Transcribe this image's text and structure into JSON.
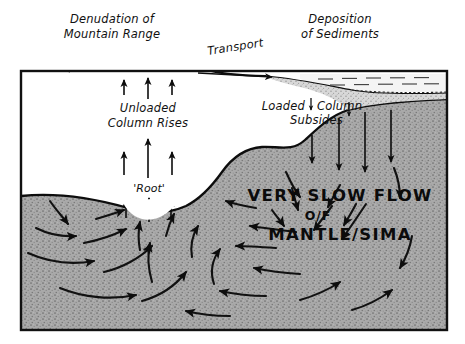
{
  "figure": {
    "frame": {
      "color": "#111111"
    },
    "labels": {
      "denudation_line1": "Denudation of",
      "denudation_line2": "Mountain Range",
      "transport": "Transport",
      "deposition_line1": "Deposition",
      "deposition_line2": "of Sediments",
      "unloaded_line1": "Unloaded",
      "unloaded_line2": "Column Rises",
      "loaded_line1a": "Loaded",
      "loaded_line1b": "Column",
      "loaded_line2": "Subsides",
      "root": "'Root'",
      "flow_line1": "VERY SLOW FLOW",
      "flow_line2": "O/F",
      "flow_line3": "MANTLE/SIMA"
    },
    "colors": {
      "ink": "#0d0d0d",
      "mantle_fill": "#a8a8a8",
      "sediment_fill": "#cfcfcf",
      "crust_fill": "#ffffff",
      "water_fill": "#f2f2f2",
      "paper": "#ffffff"
    },
    "regions": {
      "mantle_name": "mantle-sima",
      "crust_name": "crust-column",
      "sediment_name": "sediment-wedge",
      "water_name": "water-body"
    },
    "arrow_groups": {
      "denudation_uplift_count": 3,
      "root_uplift_upper_count": 3,
      "root_uplift_lower_count": 3,
      "subsidence_count": 4,
      "transport_direction": "right",
      "erosion_direction": "left"
    }
  }
}
